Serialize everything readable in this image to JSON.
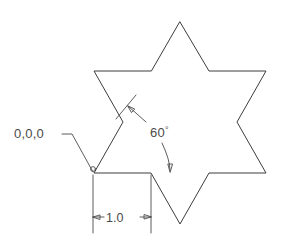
{
  "drawing": {
    "title": "Six-pointed star (hexagram) dimensioned sketch",
    "background_color": "#ffffff",
    "line_color": "#3d3d3d",
    "annotation_color": "#4a4a4a",
    "shape": {
      "name": "hexagram-star",
      "points": 6,
      "center": [
        180,
        123
      ],
      "outer_radius": 101,
      "inner_radius": 58,
      "vertices": [
        [
          180,
          22
        ],
        [
          209,
          71
        ],
        [
          266,
          71
        ],
        [
          237,
          122
        ],
        [
          266,
          173
        ],
        [
          209,
          173
        ],
        [
          180,
          224
        ],
        [
          151,
          173
        ],
        [
          94,
          173
        ],
        [
          123,
          122
        ],
        [
          94,
          71
        ],
        [
          151,
          71
        ]
      ]
    },
    "annotations": {
      "origin": {
        "label": "0,0,0",
        "label_x": 14,
        "label_y": 138,
        "leader_points": [
          [
            62,
            134
          ],
          [
            72,
            134
          ],
          [
            93,
            172
          ]
        ],
        "marker_point": [
          93,
          173
        ]
      },
      "angle": {
        "label": "60",
        "degree_symbol": "°",
        "label_x": 150,
        "label_y": 137,
        "extension_tick": [
          [
            136,
            95
          ],
          [
            116,
            119
          ]
        ],
        "leader_a": [
          [
            146,
            122
          ],
          [
            128,
            106
          ]
        ],
        "leader_b": [
          [
            162,
            143
          ],
          [
            170,
            160
          ],
          [
            170,
            170
          ]
        ],
        "arrow_a_tip": [
          128,
          106
        ],
        "arrow_b_tip": [
          170,
          172
        ]
      },
      "linear": {
        "label": "1.0",
        "label_x": 106,
        "label_y": 222,
        "value": 1.0,
        "extension_left_x": 93,
        "extension_right_x": 151,
        "extension_top_y": 175,
        "extension_bottom_y": 233,
        "dim_line_y": 217,
        "arrow_left_tip": [
          93,
          217
        ],
        "arrow_right_tip": [
          151,
          217
        ]
      }
    }
  }
}
